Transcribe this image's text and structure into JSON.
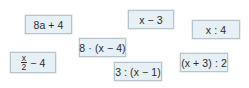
{
  "cards": [
    {
      "id": "c1",
      "label": "8a + 4"
    },
    {
      "id": "c2",
      "numerator": "x",
      "denominator": "2",
      "suffix": "− 4"
    },
    {
      "id": "c3",
      "label": "8 · (x − 4)"
    },
    {
      "id": "c4",
      "label": "x − 3"
    },
    {
      "id": "c5",
      "label": "x : 4"
    },
    {
      "id": "c6",
      "label": "3 : (x − 1)"
    },
    {
      "id": "c7",
      "label": "(x + 3) : 2"
    }
  ]
}
